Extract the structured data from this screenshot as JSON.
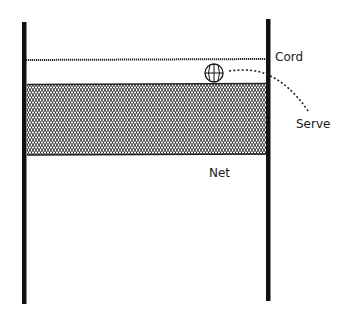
{
  "diagram": {
    "labels": {
      "cord": "Cord",
      "serve": "Serve",
      "net": "Net"
    },
    "colors": {
      "stroke": "#111111",
      "background": "#ffffff"
    },
    "icons": {
      "ball": "volleyball-icon"
    }
  }
}
